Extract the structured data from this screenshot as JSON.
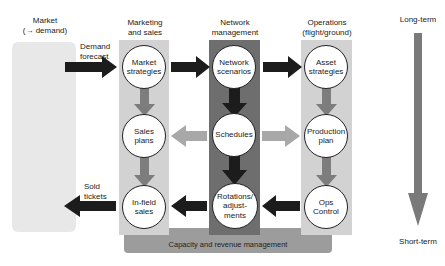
{
  "columns": [
    {
      "id": "market",
      "title_line1": "Market",
      "title_line2": "(→ demand)"
    },
    {
      "id": "marketing",
      "title_line1": "Marketing",
      "title_line2": "and sales"
    },
    {
      "id": "network",
      "title_line1": "Network",
      "title_line2": "management"
    },
    {
      "id": "operations",
      "title_line1": "Operations",
      "title_line2": "(flight/ground)"
    }
  ],
  "nodes": {
    "market_strategies": {
      "line1": "Market",
      "line2": "strategies"
    },
    "sales_plans": {
      "line1": "Sales",
      "line2": "plans"
    },
    "infield_sales": {
      "line1": "In-field",
      "line2": "sales"
    },
    "network_scenarios": {
      "line1": "Network",
      "line2": "scenarios"
    },
    "schedules": {
      "line1": "Schedules"
    },
    "rotations": {
      "line1": "Rotations/",
      "line2": "adjust-",
      "line3": "ments"
    },
    "asset_strategies": {
      "line1": "Asset",
      "line2": "strategies"
    },
    "production_plan": {
      "line1": "Production",
      "line2": "plan"
    },
    "ops_control": {
      "line1": "Ops",
      "line2": "Control"
    }
  },
  "flow_labels": {
    "demand_forecast_line1": "Demand",
    "demand_forecast_line2": "forecast",
    "sold_tickets_line1": "Sold",
    "sold_tickets_line2": "tickets"
  },
  "capacity_bar": {
    "label": "Capacity and revenue management"
  },
  "timeline": {
    "top_label": "Long-term",
    "bottom_label": "Short-term"
  },
  "colors": {
    "market_lane": "#e6e6e6",
    "side_lane": "#cfcfcf",
    "network_lane": "#6e6e6e",
    "capacity_bar": "#9a9a9a",
    "dark_arrow": "#1c1c1c",
    "mid_arrow": "#7d7d7d",
    "light_arrow": "#a8a8a8",
    "timeline_arrow": "#7a7a7a"
  }
}
